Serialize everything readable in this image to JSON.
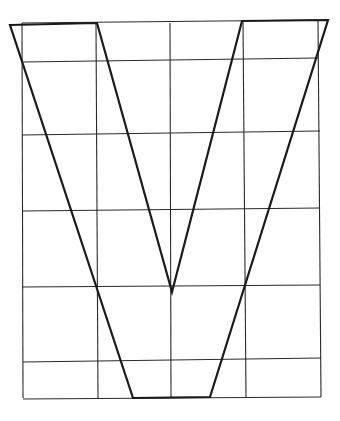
{
  "diagram": {
    "title": "",
    "colors": {
      "background": "#ffffff",
      "grid": "#2a2a2a",
      "outline": "#1a1a1a"
    },
    "grid": {
      "verticals": [
        {
          "x1": 22,
          "y1": 23,
          "x2": 23,
          "y2": 398
        },
        {
          "x1": 96,
          "y1": 23,
          "x2": 98,
          "y2": 398
        },
        {
          "x1": 170,
          "y1": 23,
          "x2": 171,
          "y2": 398
        },
        {
          "x1": 243,
          "y1": 21,
          "x2": 246,
          "y2": 397
        },
        {
          "x1": 318,
          "y1": 20,
          "x2": 321,
          "y2": 397
        }
      ],
      "horizontals": [
        {
          "x1": 22,
          "y1": 23,
          "x2": 318,
          "y2": 20
        },
        {
          "x1": 22,
          "y1": 62,
          "x2": 318,
          "y2": 58
        },
        {
          "x1": 22,
          "y1": 135,
          "x2": 320,
          "y2": 131
        },
        {
          "x1": 22,
          "y1": 211,
          "x2": 320,
          "y2": 208
        },
        {
          "x1": 22,
          "y1": 287,
          "x2": 320,
          "y2": 285
        },
        {
          "x1": 23,
          "y1": 362,
          "x2": 321,
          "y2": 358
        },
        {
          "x1": 23,
          "y1": 399,
          "x2": 321,
          "y2": 397
        }
      ]
    },
    "outline_points": "10,25 97,23 172,292 242,21 328,20 210,397 133,398"
  }
}
